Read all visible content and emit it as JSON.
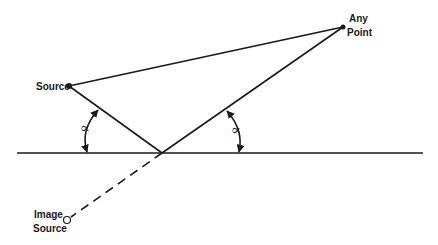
{
  "diagram": {
    "title": "",
    "labels": {
      "source": "Source",
      "any_point_line1": "Any",
      "any_point_line2": "Point",
      "image_source_line1": "Image",
      "image_source_line2": "Source",
      "angle_left": "∝",
      "angle_right": "∝"
    },
    "points": {
      "source": [
        69,
        86
      ],
      "any_point": [
        343,
        27
      ],
      "reflection": [
        162,
        153
      ],
      "image_source": [
        67,
        220
      ]
    },
    "reflecting_surface": {
      "x1": 17,
      "x2": 423,
      "y": 153
    },
    "colors": {
      "ink": "#1a1a1a",
      "background": "#ffffff"
    }
  }
}
